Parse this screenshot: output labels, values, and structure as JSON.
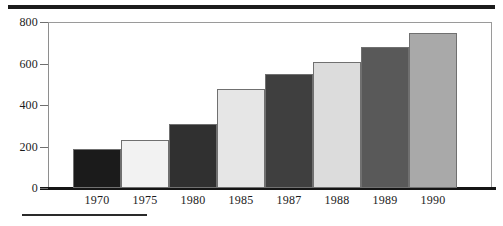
{
  "figure": {
    "background": "#ffffff",
    "rules": {
      "top_rule_color": "#1c1c1c",
      "bottom_rule_color": "#2a2a2a",
      "baseline_color": "#151515",
      "frame_color": "#9a9a9a"
    }
  },
  "chart_data": {
    "type": "bar",
    "title": "",
    "subtitle": "",
    "xlabel": "",
    "ylabel": "",
    "categories": [
      "1970",
      "1975",
      "1980",
      "1985",
      "1987",
      "1988",
      "1989",
      "1990"
    ],
    "values": [
      190,
      231,
      308,
      476,
      551,
      607,
      679,
      745
    ],
    "ylim": [
      0,
      800
    ],
    "yticks": [
      0,
      200,
      400,
      600,
      800
    ],
    "ytick_labels": [
      "0",
      "200",
      "400",
      "600",
      "800"
    ],
    "grid": false,
    "legend": null,
    "bar_colors": [
      "#1b1b1b",
      "#f2f2f2",
      "#303030",
      "#e6e6e6",
      "#3f3f3f",
      "#dcdcdc",
      "#595959",
      "#a9a9a9"
    ],
    "bar_edge_color": "#707070",
    "annotations": []
  }
}
